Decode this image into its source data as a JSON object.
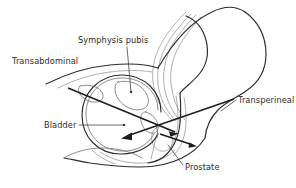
{
  "figure": {
    "type": "anatomical-line-diagram",
    "background_color": "#ffffff",
    "line_color_dark": "#2b2b2e",
    "line_color_mid": "#6f6f72",
    "line_color_faint": "#8e8e90",
    "label_color": "#2d2d30",
    "probe_color": "#1d1d20"
  },
  "labels": [
    {
      "id": "symphysis-pubis",
      "text": "Symphysis pubis",
      "x": 78,
      "y": 43,
      "anchor": "start",
      "leader": {
        "from_x": 127,
        "from_y": 47,
        "to_x": 131,
        "to_y": 92
      },
      "dot": {
        "x": 131,
        "y": 92
      }
    },
    {
      "id": "transabdominal",
      "text": "Transabdominal",
      "x": 12,
      "y": 64,
      "anchor": "start",
      "leader": null,
      "dot": null
    },
    {
      "id": "transperineal",
      "text": "Transperineal",
      "x": 238,
      "y": 103,
      "anchor": "start",
      "leader": {
        "from_x": 236,
        "from_y": 100,
        "to_x": 222,
        "to_y": 110
      },
      "dot": null
    },
    {
      "id": "bladder",
      "text": "Bladder",
      "x": 44,
      "y": 128,
      "anchor": "start",
      "leader": {
        "from_x": 79,
        "from_y": 125,
        "to_x": 124,
        "to_y": 125
      },
      "dot": {
        "x": 124,
        "y": 125
      }
    },
    {
      "id": "prostate",
      "text": "Prostate",
      "x": 185,
      "y": 170,
      "anchor": "start",
      "leader": {
        "from_x": 183,
        "from_y": 166,
        "to_x": 168,
        "to_y": 146
      },
      "dot": null
    }
  ],
  "probes": [
    {
      "id": "transabdominal-probe",
      "label_ref": "transabdominal",
      "description": "Long arrow from upper-left abdominal wall angling down-right into the bladder / prostate junction",
      "start_x": 68,
      "start_y": 88,
      "end_x": 178,
      "end_y": 133,
      "arrowhead": "end"
    },
    {
      "id": "transperineal-probe",
      "label_ref": "transperineal",
      "description": "Long arrow from lower-right perineum angling up-left, with arrowhead pointing down-left toward the bladder base",
      "start_x": 234,
      "start_y": 99,
      "end_x": 122,
      "end_y": 138,
      "arrowhead": "end"
    },
    {
      "id": "transrectal-probe",
      "label_ref": "prostate",
      "description": "Short arrow from the prostate region pointing right toward the rectum",
      "start_x": 160,
      "start_y": 134,
      "end_x": 197,
      "end_y": 146,
      "arrowhead": "end"
    }
  ],
  "anatomy_parts": [
    {
      "id": "abdominal-wall",
      "name": "anterior abdominal wall"
    },
    {
      "id": "sacrum-spine",
      "name": "sacrum and lumbar spine"
    },
    {
      "id": "pubic-bone",
      "name": "pubic bone / symphysis pubis"
    },
    {
      "id": "bladder",
      "name": "urinary bladder"
    },
    {
      "id": "prostate-gland",
      "name": "prostate gland"
    },
    {
      "id": "urethra",
      "name": "urethra"
    },
    {
      "id": "rectum",
      "name": "rectum"
    },
    {
      "id": "perineum",
      "name": "perineum and scrotum outline"
    },
    {
      "id": "buttock",
      "name": "gluteal / buttock contour"
    }
  ]
}
